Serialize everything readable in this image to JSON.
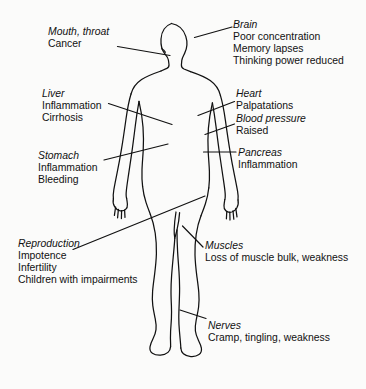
{
  "diagram": {
    "figure_name": "human-body-outline",
    "colors": {
      "background": "#fbfbfa",
      "ink": "#111111",
      "leader_line": "#111111"
    }
  },
  "callouts": [
    {
      "id": "mouth-throat",
      "organ": "Mouth, throat",
      "symptoms": [
        "Cancer"
      ],
      "side": "left",
      "x": 48,
      "y": 26
    },
    {
      "id": "brain",
      "organ": "Brain",
      "symptoms": [
        "Poor concentration",
        "Memory lapses",
        "Thinking power reduced"
      ],
      "side": "right",
      "x": 233,
      "y": 19
    },
    {
      "id": "liver",
      "organ": "Liver",
      "symptoms": [
        "Inflammation",
        "Cirrhosis"
      ],
      "side": "left",
      "x": 42,
      "y": 88
    },
    {
      "id": "heart",
      "organ": "Heart",
      "symptoms": [
        "Palpatations"
      ],
      "side": "right",
      "x": 236,
      "y": 88
    },
    {
      "id": "blood-pressure",
      "organ": "Blood pressure",
      "symptoms": [
        "Raised"
      ],
      "side": "right",
      "x": 236,
      "y": 113
    },
    {
      "id": "stomach",
      "organ": "Stomach",
      "symptoms": [
        "Inflammation",
        "Bleeding"
      ],
      "side": "left",
      "x": 38,
      "y": 150
    },
    {
      "id": "pancreas",
      "organ": "Pancreas",
      "symptoms": [
        "Inflammation"
      ],
      "side": "right",
      "x": 238,
      "y": 147
    },
    {
      "id": "reproduction",
      "organ": "Reproduction",
      "symptoms": [
        "Impotence",
        "Infertility",
        "Children with impairments"
      ],
      "side": "left",
      "x": 18,
      "y": 238
    },
    {
      "id": "muscles",
      "organ": "Muscles",
      "symptoms": [
        "Loss of muscle bulk, weakness"
      ],
      "side": "right",
      "x": 205,
      "y": 240
    },
    {
      "id": "nerves",
      "organ": "Nerves",
      "symptoms": [
        "Cramp, tingling, weakness"
      ],
      "side": "right",
      "x": 208,
      "y": 320
    }
  ]
}
